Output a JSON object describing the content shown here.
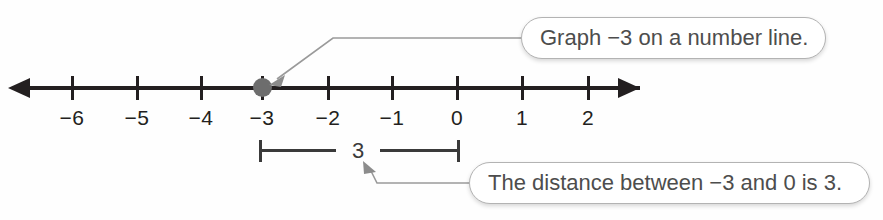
{
  "figure": {
    "type": "number-line-diagram",
    "background_color": "#fefefe",
    "line_color": "#231f20",
    "point_color": "#6d6d6d",
    "bracket_color": "#3a3a3a",
    "callout_border_color": "#b3b3b3",
    "callout_text_color": "#4d4d4d"
  },
  "number_line": {
    "min": -6,
    "max": 2,
    "has_left_arrow": true,
    "has_right_arrow": true,
    "ticks": [
      {
        "value": -6,
        "label": "−6",
        "x": 72
      },
      {
        "value": -5,
        "label": "−5",
        "x": 137
      },
      {
        "value": -4,
        "label": "−4",
        "x": 201
      },
      {
        "value": -3,
        "label": "−3",
        "x": 262
      },
      {
        "value": -2,
        "label": "−2",
        "x": 328
      },
      {
        "value": -1,
        "label": "−1",
        "x": 392
      },
      {
        "value": 0,
        "label": "0",
        "x": 457
      },
      {
        "value": 1,
        "label": "1",
        "x": 522
      },
      {
        "value": 2,
        "label": "2",
        "x": 588
      }
    ],
    "plotted_point": {
      "value": -3,
      "x": 262,
      "label": "−3"
    }
  },
  "measurement": {
    "label": "3",
    "from_value": -3,
    "to_value": 0,
    "left_x": 259,
    "right_x": 457
  },
  "callouts": [
    {
      "id": "graph",
      "text": "Graph −3 on a number line.",
      "points_to": "plotted-point"
    },
    {
      "id": "distance",
      "text": "The distance between −3 and 0 is 3.",
      "points_to": "measurement-bracket"
    }
  ]
}
